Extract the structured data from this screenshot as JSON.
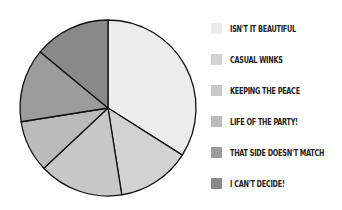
{
  "chart_data": {
    "type": "pie",
    "title": "",
    "categories": [
      "ISN'T IT BEAUTIFUL",
      "CASUAL WINKS",
      "KEEPING THE PEACE",
      "LIFE OF THE PARTY!",
      "THAT SIDE DOESN'T MATCH",
      "I CAN'T DECIDE!"
    ],
    "values": [
      34,
      13.5,
      15.5,
      9.5,
      13.5,
      14
    ],
    "colors": [
      "#ececec",
      "#d2d2d2",
      "#c8c8c8",
      "#bbbbbb",
      "#9c9c9c",
      "#898989"
    ],
    "legend_position": "right",
    "start_angle_deg": 0,
    "direction": "clockwise"
  },
  "legend": {
    "items": [
      {
        "label": "ISN'T IT BEAUTIFUL",
        "color": "#ececec"
      },
      {
        "label": "CASUAL WINKS",
        "color": "#d2d2d2"
      },
      {
        "label": "KEEPING THE PEACE",
        "color": "#c8c8c8"
      },
      {
        "label": "LIFE OF THE PARTY!",
        "color": "#bbbbbb"
      },
      {
        "label": "THAT SIDE DOESN'T MATCH",
        "color": "#9c9c9c"
      },
      {
        "label": "I CAN'T DECIDE!",
        "color": "#898989"
      }
    ]
  }
}
